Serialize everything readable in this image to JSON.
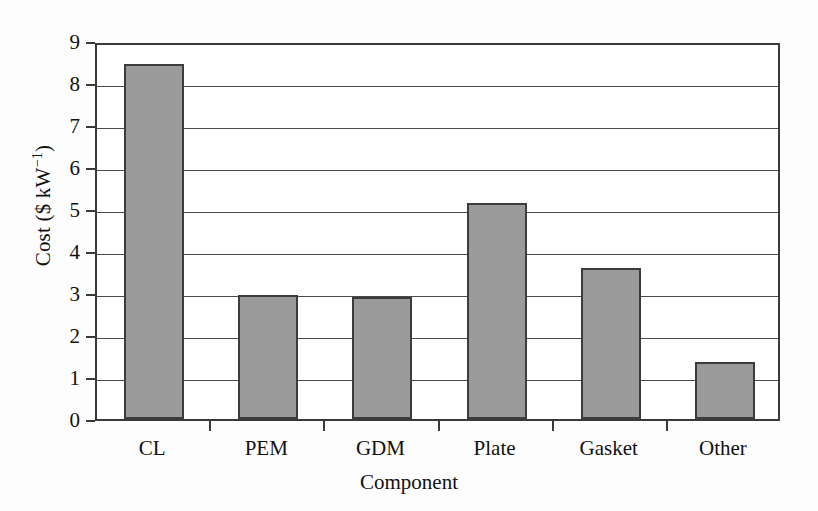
{
  "chart_data": {
    "type": "bar",
    "title": "",
    "categories": [
      "CL",
      "PEM",
      "GDM",
      "Plate",
      "Gasket",
      "Other"
    ],
    "values": [
      8.5,
      3.0,
      2.95,
      5.2,
      3.65,
      1.4
    ],
    "xlabel": "Component",
    "ylabel_text": "Cost ($ kW",
    "ylabel_exponent": "−1",
    "ylabel_tail": ")",
    "ylabel_full": "Cost ($ kW⁻¹)",
    "ylim": [
      0,
      9
    ],
    "ytick_labels": [
      "9",
      "8",
      "7",
      "6",
      "5",
      "4",
      "3",
      "2",
      "1",
      "0"
    ],
    "ytick_values": [
      9,
      8,
      7,
      6,
      5,
      4,
      3,
      2,
      1,
      0
    ],
    "grid": true,
    "legend": "none",
    "colors": {
      "bar_fill": "#9a9a9a",
      "bar_border": "#3c3c3c",
      "axis": "#3a3a3a",
      "gridline": "#4a4a4a",
      "text": "#111111",
      "background": "#fdfdfd",
      "plot_background": "#ffffff"
    }
  }
}
